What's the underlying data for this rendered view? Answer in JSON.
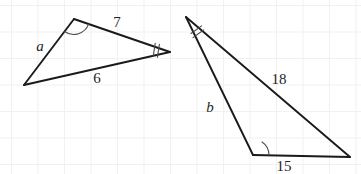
{
  "figure": {
    "background_color": "#ffffff",
    "grid_color": "#f2f0f0",
    "stroke_color": "#1a1a1a",
    "mark_color": "#4a4a4a",
    "width": 361,
    "height": 174
  },
  "left_triangle": {
    "name": "left-triangle",
    "vertices": {
      "top": [
        74,
        19
      ],
      "bottom_left": [
        24,
        85
      ],
      "right": [
        170,
        52
      ]
    },
    "labels": {
      "side_a": "a",
      "side_7": "7",
      "side_6": "6"
    },
    "label_positions": {
      "side_a": [
        40,
        51
      ],
      "side_7": [
        117,
        27
      ],
      "side_6": [
        97,
        83
      ]
    },
    "angle_marks": {
      "top_vertex": "single-arc",
      "right_vertex": "double-tick"
    }
  },
  "right_triangle": {
    "name": "right-triangle",
    "vertices": {
      "apex": [
        186,
        17
      ],
      "bottom_left": [
        253,
        155
      ],
      "bottom_right": [
        350,
        157
      ]
    },
    "labels": {
      "side_b": "b",
      "side_18": "18",
      "side_15": "15"
    },
    "label_positions": {
      "side_b": [
        210,
        112
      ],
      "side_18": [
        279,
        84
      ],
      "side_15": [
        284,
        171
      ]
    },
    "angle_marks": {
      "apex_vertex": "double-tick",
      "bottom_left_vertex": "single-arc"
    }
  }
}
